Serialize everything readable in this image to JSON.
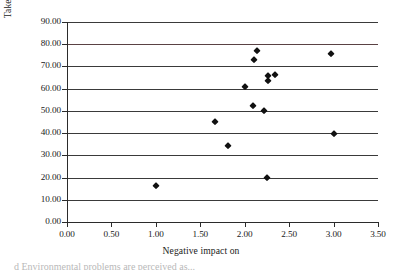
{
  "chart_data": {
    "type": "scatter",
    "title": "",
    "xlabel": "Negative impact on",
    "ylabel": "Taken actions on",
    "xlim": [
      0.0,
      3.5
    ],
    "ylim": [
      0.0,
      90.0
    ],
    "xticks": [
      "0.00",
      "0.50",
      "1.00",
      "1.50",
      "2.00",
      "2.50",
      "3.00",
      "3.50"
    ],
    "xtick_values": [
      0.0,
      0.5,
      1.0,
      1.5,
      2.0,
      2.5,
      3.0,
      3.5
    ],
    "yticks": [
      "0.00",
      "10.00",
      "20.00",
      "30.00",
      "40.00",
      "50.00",
      "60.00",
      "70.00",
      "80.00",
      "90.00"
    ],
    "ytick_values": [
      0,
      10,
      20,
      30,
      40,
      50,
      60,
      70,
      80,
      90
    ],
    "grid": "horizontal",
    "legend": "none",
    "marker": "diamond",
    "marker_color": "#111111",
    "points": [
      {
        "x": 1.0,
        "y": 16.3
      },
      {
        "x": 1.67,
        "y": 45.1
      },
      {
        "x": 1.81,
        "y": 34.4
      },
      {
        "x": 2.0,
        "y": 60.6
      },
      {
        "x": 2.09,
        "y": 52.2
      },
      {
        "x": 2.1,
        "y": 72.8
      },
      {
        "x": 2.14,
        "y": 77.0
      },
      {
        "x": 2.22,
        "y": 49.8
      },
      {
        "x": 2.25,
        "y": 19.7
      },
      {
        "x": 2.26,
        "y": 65.6
      },
      {
        "x": 2.26,
        "y": 63.5
      },
      {
        "x": 2.34,
        "y": 66.2
      },
      {
        "x": 2.97,
        "y": 75.6
      },
      {
        "x": 3.0,
        "y": 39.6
      }
    ]
  },
  "caption": {
    "cut_off_text": "d Environmental problems are perceived as..."
  }
}
